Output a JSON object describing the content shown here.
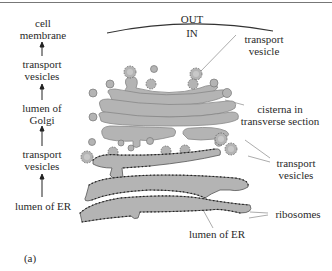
{
  "figure": {
    "panel_label": "(a)",
    "boundary": {
      "out_label": "OUT",
      "in_label": "IN"
    },
    "pathway": [
      {
        "label_line1": "cell",
        "label_line2": "membrane"
      },
      {
        "label_line1": "transport",
        "label_line2": "vesicles"
      },
      {
        "label_line1": "lumen of",
        "label_line2": "Golgi"
      },
      {
        "label_line1": "transport",
        "label_line2": "vesicles"
      },
      {
        "label_line1": "lumen of ER",
        "label_line2": ""
      }
    ],
    "annotations": [
      {
        "id": "transport-vesicle",
        "line1": "transport",
        "line2": "vesicle"
      },
      {
        "id": "cisterna",
        "line1": "cisterna in",
        "line2": "transverse section"
      },
      {
        "id": "transport-vesicles",
        "line1": "transport",
        "line2": "vesicles"
      },
      {
        "id": "ribosomes",
        "line1": "ribosomes",
        "line2": ""
      },
      {
        "id": "lumen-er",
        "line1": "lumen of ER",
        "line2": ""
      }
    ],
    "colors": {
      "organelle_fill": "#b4b4b4",
      "outline": "#555555",
      "ribosome": "#222222",
      "text": "#2a2a2a"
    }
  }
}
